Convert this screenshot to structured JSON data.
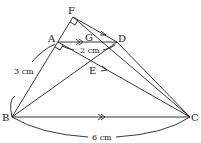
{
  "diagram": {
    "points": {
      "F": {
        "label": "F",
        "x": 73,
        "y": 17
      },
      "A": {
        "label": "A",
        "x": 58,
        "y": 42
      },
      "G": {
        "label": "G",
        "x": 88,
        "y": 42
      },
      "D": {
        "label": "D",
        "x": 117,
        "y": 42
      },
      "E": {
        "label": "E",
        "x": 94,
        "y": 66
      },
      "B": {
        "label": "B",
        "x": 12,
        "y": 117
      },
      "C": {
        "label": "C",
        "x": 190,
        "y": 117
      }
    },
    "measurements": {
      "AB": "3 cm",
      "AD": "2 cm",
      "BC": "6 cm"
    },
    "colors": {
      "stroke": "#222222",
      "background": "#ffffff"
    }
  }
}
